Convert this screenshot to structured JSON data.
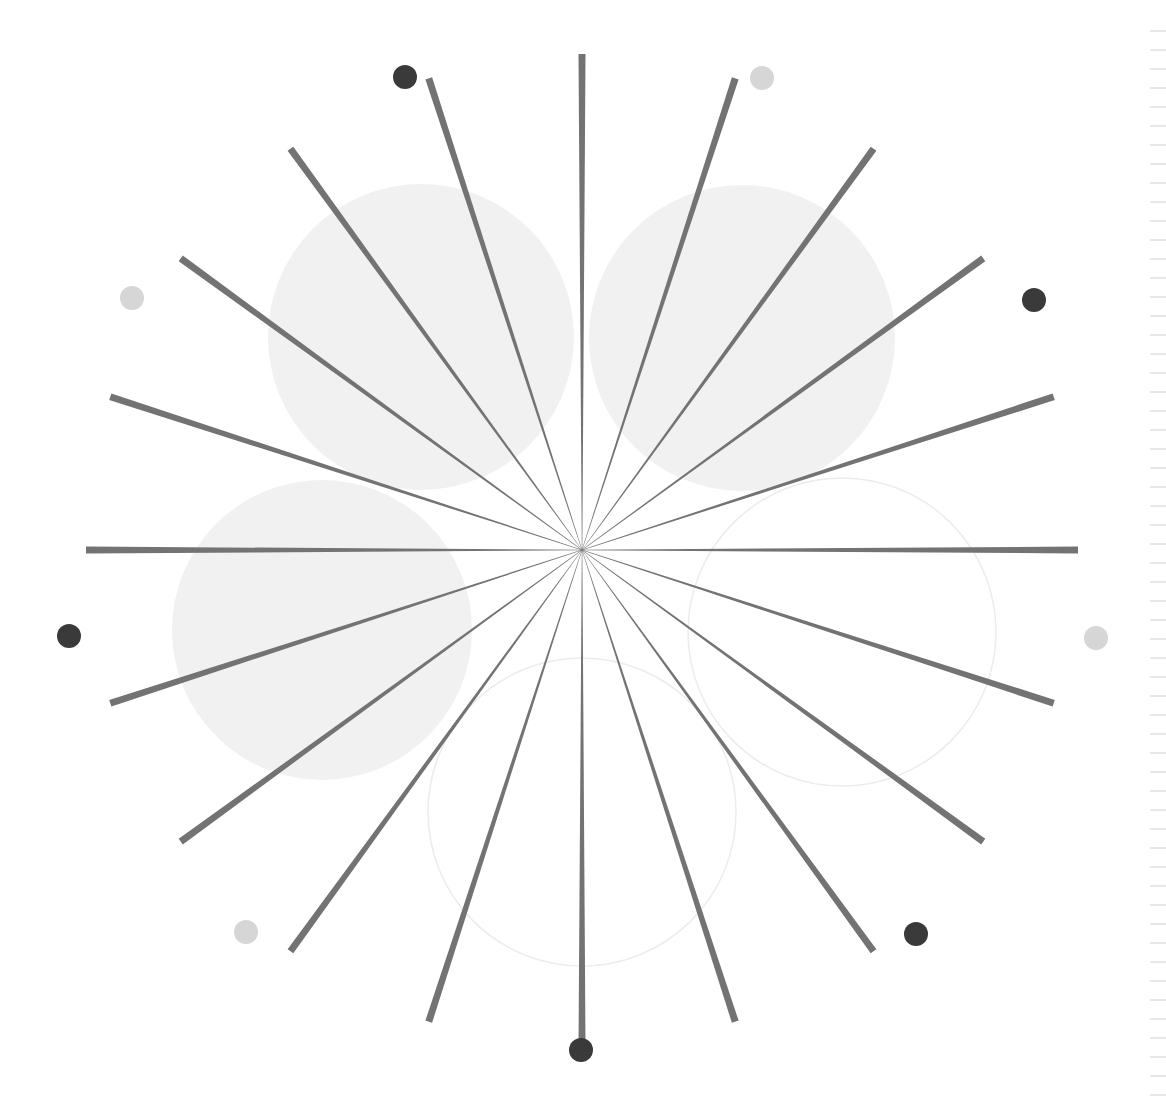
{
  "diagram": {
    "title": "",
    "center": {
      "x": 582,
      "y": 550
    },
    "rays": {
      "count": 20,
      "angle_step_deg": 18,
      "inner_radius": 0,
      "outer_radius": 496,
      "inner_width": 0.5,
      "outer_width": 7,
      "color": "#737373"
    },
    "circles": [
      {
        "name": "circle-top-left",
        "cx": 421,
        "cy": 337,
        "r": 153,
        "fill": "#f1f1f1",
        "stroke": "none"
      },
      {
        "name": "circle-top-right",
        "cx": 742,
        "cy": 338,
        "r": 153,
        "fill": "#f1f1f1",
        "stroke": "none"
      },
      {
        "name": "circle-left",
        "cx": 322,
        "cy": 630,
        "r": 150,
        "fill": "#f1f1f1",
        "stroke": "none"
      },
      {
        "name": "circle-right",
        "cx": 842,
        "cy": 632,
        "r": 154,
        "fill": "none",
        "stroke": "#ececec"
      },
      {
        "name": "circle-bottom",
        "cx": 582,
        "cy": 812,
        "r": 154,
        "fill": "none",
        "stroke": "#ececec"
      }
    ],
    "dots": [
      {
        "name": "dot-top-left",
        "x": 405,
        "y": 77,
        "shade": "dark"
      },
      {
        "name": "dot-top-right",
        "x": 762,
        "y": 78,
        "shade": "light"
      },
      {
        "name": "dot-upper-right",
        "x": 1034,
        "y": 300,
        "shade": "dark"
      },
      {
        "name": "dot-right",
        "x": 1096,
        "y": 638,
        "shade": "light"
      },
      {
        "name": "dot-lower-right",
        "x": 916,
        "y": 934,
        "shade": "dark"
      },
      {
        "name": "dot-bottom",
        "x": 581,
        "y": 1050,
        "shade": "dark"
      },
      {
        "name": "dot-lower-left",
        "x": 246,
        "y": 932,
        "shade": "light"
      },
      {
        "name": "dot-left",
        "x": 69,
        "y": 636,
        "shade": "dark"
      },
      {
        "name": "dot-upper-left",
        "x": 132,
        "y": 298,
        "shade": "light"
      }
    ],
    "dot_radius": 12,
    "colors": {
      "dark": "#3a3a3a",
      "light": "#d6d6d6",
      "ruler": "#d0d0d0"
    },
    "ruler": {
      "tick_count": 58,
      "spacing": 19
    }
  }
}
